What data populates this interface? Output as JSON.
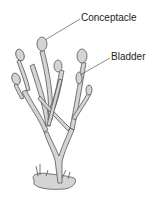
{
  "diagram": {
    "labels": [
      {
        "id": "conceptacle",
        "text": "Conceptacle"
      },
      {
        "id": "bladder",
        "text": "Bladder"
      }
    ],
    "colors": {
      "background": "#ffffff",
      "fill": "#d4d4d4",
      "stroke": "#555555",
      "text": "#222222"
    }
  }
}
